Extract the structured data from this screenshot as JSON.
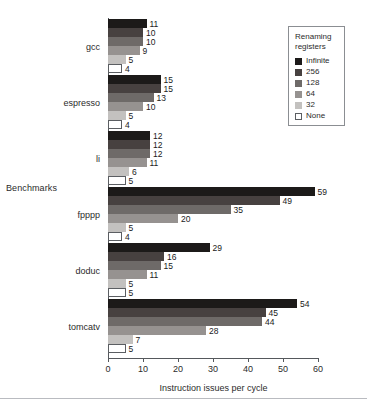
{
  "chart_data": {
    "type": "bar",
    "orientation": "horizontal",
    "title": "",
    "xlabel": "Instruction issues per cycle",
    "ylabel": "Benchmarks",
    "xlim": [
      0,
      60
    ],
    "xticks": [
      0,
      10,
      20,
      30,
      40,
      50,
      60
    ],
    "grid": false,
    "legend_position": "top-right",
    "legend_title": "Renaming registers",
    "categories": [
      "gcc",
      "espresso",
      "li",
      "fpppp",
      "doduc",
      "tomcatv"
    ],
    "series": [
      {
        "name": "Infinite",
        "color": "#1c1a19",
        "values": [
          11,
          15,
          12,
          59,
          29,
          54
        ]
      },
      {
        "name": "256",
        "color": "#474140",
        "values": [
          10,
          15,
          12,
          49,
          16,
          45
        ]
      },
      {
        "name": "128",
        "color": "#6e6a68",
        "values": [
          10,
          13,
          12,
          35,
          15,
          44
        ]
      },
      {
        "name": "64",
        "color": "#969290",
        "values": [
          9,
          10,
          11,
          20,
          11,
          28
        ]
      },
      {
        "name": "32",
        "color": "#c3c1bf",
        "values": [
          5,
          5,
          6,
          5,
          5,
          7
        ]
      },
      {
        "name": "None",
        "color": "#ffffff",
        "values": [
          4,
          4,
          5,
          4,
          5,
          5
        ]
      }
    ]
  },
  "legend": {
    "title_line1": "Renaming",
    "title_line2": "registers"
  },
  "axis": {
    "x_title": "Instruction issues per cycle",
    "y_title": "Benchmarks"
  }
}
